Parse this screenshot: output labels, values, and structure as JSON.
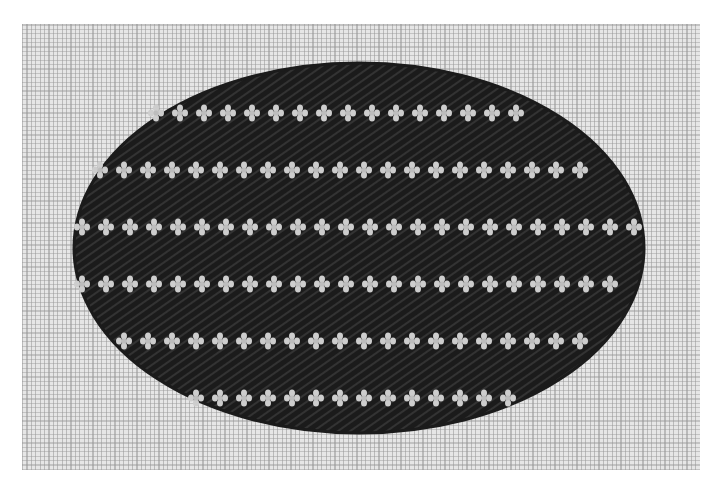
{
  "caption": {
    "text": ""
  },
  "scene": {
    "subject": "needlepoint oval on canvas",
    "colors": {
      "page": "#ffffff",
      "canvas": "#e6e6e6",
      "yarn_dark": "#1b1b1b",
      "yarn_dark_highlight": "#3a3a3a",
      "yarn_light": "#cdcdcd"
    },
    "canvas_bounds": {
      "x": 22,
      "y": 24,
      "width": 678,
      "height": 446
    },
    "oval": {
      "cx": 359,
      "cy": 248,
      "rx": 285,
      "ry": 185
    },
    "dot_rows": [
      {
        "y": 113,
        "x_start": 156,
        "x_end": 528,
        "spacing": 24
      },
      {
        "y": 170,
        "x_start": 100,
        "x_end": 600,
        "spacing": 24
      },
      {
        "y": 227,
        "x_start": 82,
        "x_end": 634,
        "spacing": 24
      },
      {
        "y": 284,
        "x_start": 82,
        "x_end": 626,
        "spacing": 24
      },
      {
        "y": 341,
        "x_start": 124,
        "x_end": 602,
        "spacing": 24
      },
      {
        "y": 398,
        "x_start": 196,
        "x_end": 510,
        "spacing": 24
      }
    ]
  }
}
